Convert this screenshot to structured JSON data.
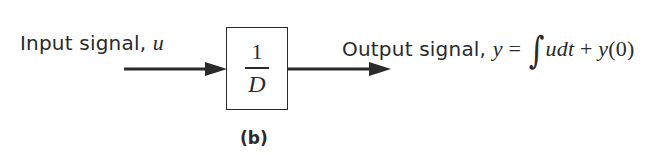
{
  "diagram": {
    "type": "block_diagram",
    "input": {
      "label_text": "Input signal, ",
      "label_symbol": "u"
    },
    "block": {
      "numerator": "1",
      "denominator": "D",
      "meaning": "integrator transfer function 1/D"
    },
    "output": {
      "label_text": "Output signal, ",
      "equation": {
        "lhs": "y",
        "equals": " = ",
        "integral_sign": "∫",
        "integrand": "udt",
        "plus": " + ",
        "initial_term_symbol": "y",
        "initial_term_arg": "(0)"
      }
    },
    "caption": "(b)",
    "colors": {
      "ink": "#2a2a2a",
      "background": "#ffffff"
    }
  }
}
